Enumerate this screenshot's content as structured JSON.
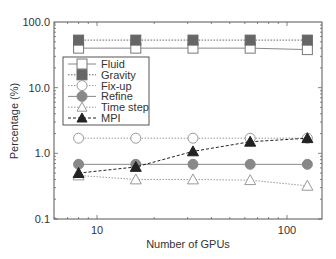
{
  "chart_data": {
    "type": "line",
    "title": "",
    "xlabel": "Number of GPUs",
    "ylabel": "Percentage (%)",
    "xscale": "log",
    "yscale": "log",
    "xlim": [
      6.5,
      150
    ],
    "ylim": [
      0.1,
      100
    ],
    "x_ticks": [
      10,
      100
    ],
    "x_tick_labels": [
      "10",
      "100"
    ],
    "y_ticks": [
      0.1,
      1,
      10,
      100
    ],
    "y_tick_labels": [
      "0.1",
      "1.0",
      "10.0",
      "100.0"
    ],
    "grid": false,
    "legend_position": "upper left (inside)",
    "x": [
      8,
      16,
      32,
      64,
      128
    ],
    "series": [
      {
        "name": "Fluid",
        "values": [
          40,
          40,
          40,
          40,
          38
        ],
        "marker": "open-square",
        "line": "solid",
        "color": "#888888"
      },
      {
        "name": "Gravity",
        "values": [
          53,
          53,
          53,
          53,
          53
        ],
        "marker": "filled-square",
        "line": "dotted",
        "color": "#666666"
      },
      {
        "name": "Fix-up",
        "values": [
          1.7,
          1.7,
          1.7,
          1.7,
          1.7
        ],
        "marker": "open-circle",
        "line": "dotted",
        "color": "#999999"
      },
      {
        "name": "Refine",
        "values": [
          0.68,
          0.68,
          0.68,
          0.68,
          0.68
        ],
        "marker": "filled-circle",
        "line": "solid",
        "color": "#888888"
      },
      {
        "name": "Time step",
        "values": [
          0.46,
          0.4,
          0.4,
          0.39,
          0.32
        ],
        "marker": "open-triangle",
        "line": "dotted",
        "color": "#999999"
      },
      {
        "name": "MPI",
        "values": [
          0.5,
          0.62,
          1.07,
          1.5,
          1.7
        ],
        "marker": "filled-triangle",
        "line": "dashed",
        "color": "#222222"
      }
    ]
  }
}
